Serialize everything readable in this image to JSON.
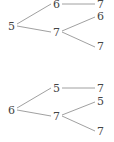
{
  "trees": [
    {
      "root": "5",
      "branches": [
        {
          "node": "6",
          "children": [
            "7"
          ]
        },
        {
          "node": "7",
          "children": [
            "6",
            "7"
          ]
        }
      ]
    },
    {
      "root": "6",
      "branches": [
        {
          "node": "5",
          "children": [
            "7"
          ]
        },
        {
          "node": "7",
          "children": [
            "5",
            "7"
          ]
        }
      ]
    }
  ]
}
